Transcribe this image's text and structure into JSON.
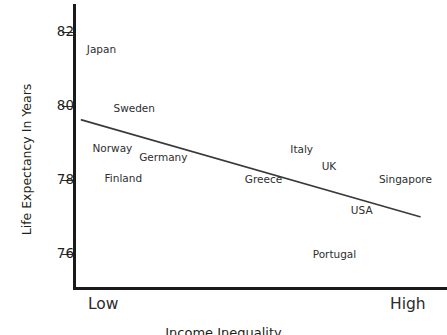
{
  "chart_data": {
    "type": "scatter",
    "title": "",
    "subtitle": "",
    "xlabel": "Income Inequality",
    "ylabel": "Life Expectancy In Years",
    "x_tick_labels": [
      "Low",
      "High"
    ],
    "y_ticks": [
      76,
      78,
      80,
      82
    ],
    "y_tick_labels": [
      "76",
      "78",
      "80",
      "82"
    ],
    "ylim": [
      75.1,
      82.7
    ],
    "xlim": [
      0,
      100
    ],
    "grid": false,
    "legend": null,
    "annotations_are_labels_only": true,
    "axis_color": "#1a1a1a",
    "text_color": "#231f20",
    "line_color": "#3a3a3a",
    "background": "#ffffff",
    "points": [
      {
        "name": "Japan",
        "x": 7,
        "y": 81.55
      },
      {
        "name": "Sweden",
        "x": 16,
        "y": 79.95
      },
      {
        "name": "Norway",
        "x": 10,
        "y": 78.87
      },
      {
        "name": "Germany",
        "x": 24,
        "y": 78.62
      },
      {
        "name": "Finland",
        "x": 13,
        "y": 78.05
      },
      {
        "name": "Greece",
        "x": 51.5,
        "y": 78.03
      },
      {
        "name": "Italy",
        "x": 62,
        "y": 78.82
      },
      {
        "name": "UK",
        "x": 69.5,
        "y": 78.38
      },
      {
        "name": "Singapore",
        "x": 90.5,
        "y": 78.03
      },
      {
        "name": "USA",
        "x": 78.5,
        "y": 77.17
      },
      {
        "name": "Portugal",
        "x": 71,
        "y": 76.0
      }
    ],
    "trendline": {
      "x_start": 1.5,
      "y_start": 79.62,
      "x_end": 94.5,
      "y_end": 77.0
    }
  }
}
